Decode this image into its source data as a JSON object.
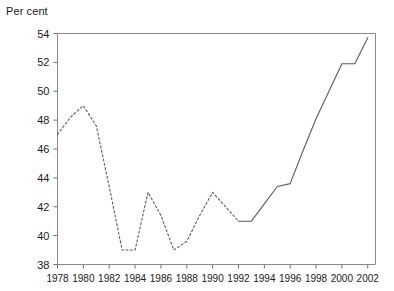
{
  "chart_data": {
    "type": "line",
    "title": "",
    "ylabel": "Per cent",
    "xlabel": "",
    "ylim": [
      38,
      54
    ],
    "xlim": [
      1978,
      2002.6
    ],
    "grid": false,
    "legend": null,
    "y_ticks": [
      38,
      40,
      42,
      44,
      46,
      48,
      50,
      52,
      54
    ],
    "y_tick_labels": [
      "38",
      "40",
      "42",
      "44",
      "46",
      "48",
      "50",
      "52",
      "54"
    ],
    "x_ticks": [
      1978,
      1980,
      1982,
      1984,
      1986,
      1988,
      1990,
      1992,
      1994,
      1996,
      1998,
      2000,
      2002
    ],
    "x_tick_labels": [
      "1978",
      "1980",
      "1982",
      "1984",
      "1986",
      "1988",
      "1990",
      "1992",
      "1994",
      "1996",
      "1998",
      "2000",
      "2002"
    ],
    "series": [
      {
        "name": "Per cent (estimated)",
        "style": "dashed",
        "x": [
          1978,
          1979,
          1980,
          1981,
          1982,
          1983,
          1984,
          1985,
          1986,
          1987,
          1988,
          1989,
          1990,
          1991,
          1992
        ],
        "values": [
          47.0,
          48.2,
          49.0,
          47.6,
          43.4,
          39.0,
          39.0,
          43.0,
          41.4,
          39.0,
          39.6,
          41.4,
          43.0,
          42.0,
          41.0
        ]
      },
      {
        "name": "Per cent (actual)",
        "style": "solid",
        "x": [
          1992,
          1993,
          1994,
          1995,
          1996,
          1997,
          1998,
          1999,
          2000,
          2001,
          2002
        ],
        "values": [
          41.0,
          41.0,
          42.2,
          43.4,
          43.6,
          45.9,
          48.1,
          50.0,
          51.9,
          51.9,
          53.7
        ]
      }
    ]
  },
  "axis": {
    "y_title": "Per cent"
  }
}
